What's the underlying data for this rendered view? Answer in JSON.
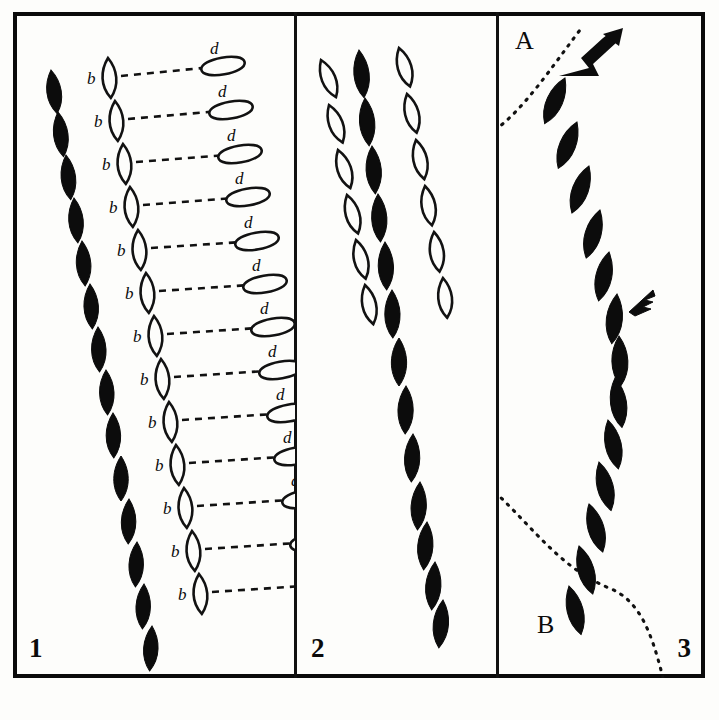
{
  "plate": {
    "title": "Comparative track-pattern plate",
    "background_color": "#fdfdfb",
    "ink_color": "#0c0c0c",
    "border_color": "#0a0a0a"
  },
  "panels": [
    {
      "number": "1",
      "label_b": "b",
      "label_d": "d",
      "description": "Filled teardrop trail at left; each outlined teardrop b linked by a dashed line to an outlined oval d",
      "filled_trail": [
        {
          "x": 38,
          "y": 58,
          "w": 19,
          "h": 44,
          "rot": -8
        },
        {
          "x": 45,
          "y": 100,
          "w": 19,
          "h": 45,
          "rot": -7
        },
        {
          "x": 53,
          "y": 143,
          "w": 19,
          "h": 45,
          "rot": -6
        },
        {
          "x": 61,
          "y": 186,
          "w": 19,
          "h": 45,
          "rot": -5
        },
        {
          "x": 69,
          "y": 229,
          "w": 19,
          "h": 45,
          "rot": -4
        },
        {
          "x": 77,
          "y": 272,
          "w": 19,
          "h": 45,
          "rot": -3
        },
        {
          "x": 85,
          "y": 315,
          "w": 19,
          "h": 45,
          "rot": -2
        },
        {
          "x": 93,
          "y": 358,
          "w": 19,
          "h": 45,
          "rot": -2
        },
        {
          "x": 100,
          "y": 401,
          "w": 19,
          "h": 45,
          "rot": -1
        },
        {
          "x": 108,
          "y": 444,
          "w": 19,
          "h": 45,
          "rot": 0
        },
        {
          "x": 116,
          "y": 487,
          "w": 19,
          "h": 45,
          "rot": 1
        },
        {
          "x": 124,
          "y": 530,
          "w": 19,
          "h": 45,
          "rot": 2
        },
        {
          "x": 131,
          "y": 572,
          "w": 19,
          "h": 45,
          "rot": 2
        },
        {
          "x": 139,
          "y": 614,
          "w": 19,
          "h": 45,
          "rot": 3
        }
      ],
      "pairs": [
        {
          "bx": 95,
          "by": 46,
          "dx": 160,
          "dy": 36,
          "blabel_x": 74,
          "blabel_y": 50,
          "dlabel_x": 197,
          "dlabel_y": 24
        },
        {
          "bx": 102,
          "by": 89,
          "dx": 168,
          "dy": 80,
          "blabel_x": 81,
          "blabel_y": 93,
          "dlabel_x": 205,
          "dlabel_y": 67
        },
        {
          "bx": 110,
          "by": 132,
          "dx": 177,
          "dy": 124,
          "blabel_x": 89,
          "blabel_y": 136,
          "dlabel_x": 214,
          "dlabel_y": 111
        },
        {
          "bx": 117,
          "by": 175,
          "dx": 185,
          "dy": 167,
          "blabel_x": 96,
          "blabel_y": 179,
          "dlabel_x": 222,
          "dlabel_y": 154
        },
        {
          "bx": 125,
          "by": 218,
          "dx": 194,
          "dy": 211,
          "blabel_x": 104,
          "blabel_y": 222,
          "dlabel_x": 231,
          "dlabel_y": 198
        },
        {
          "bx": 133,
          "by": 261,
          "dx": 202,
          "dy": 254,
          "blabel_x": 112,
          "blabel_y": 265,
          "dlabel_x": 239,
          "dlabel_y": 241
        },
        {
          "bx": 141,
          "by": 304,
          "dx": 210,
          "dy": 297,
          "blabel_x": 120,
          "blabel_y": 308,
          "dlabel_x": 247,
          "dlabel_y": 284
        },
        {
          "bx": 148,
          "by": 347,
          "dx": 218,
          "dy": 340,
          "blabel_x": 127,
          "blabel_y": 351,
          "dlabel_x": 255,
          "dlabel_y": 327
        },
        {
          "bx": 156,
          "by": 390,
          "dx": 226,
          "dy": 383,
          "blabel_x": 135,
          "blabel_y": 394,
          "dlabel_x": 263,
          "dlabel_y": 370
        },
        {
          "bx": 163,
          "by": 433,
          "dx": 233,
          "dy": 426,
          "blabel_x": 142,
          "blabel_y": 437,
          "dlabel_x": 270,
          "dlabel_y": 413
        },
        {
          "bx": 171,
          "by": 476,
          "dx": 241,
          "dy": 469,
          "blabel_x": 150,
          "blabel_y": 480,
          "dlabel_x": 278,
          "dlabel_y": 456
        },
        {
          "bx": 179,
          "by": 519,
          "dx": 249,
          "dy": 512,
          "blabel_x": 158,
          "blabel_y": 523,
          "dlabel_x": 286,
          "dlabel_y": 499
        },
        {
          "bx": 186,
          "by": 562,
          "dx": 256,
          "dy": 555,
          "blabel_x": 165,
          "blabel_y": 566,
          "dlabel_x": 293,
          "dlabel_y": 542
        }
      ]
    },
    {
      "number": "2",
      "description": "Three parallel trails: outlined teardrops left, filled teardrops centre, outlined teardrops right",
      "left_open": [
        {
          "x": 24,
          "y": 48,
          "w": 18,
          "h": 40,
          "rot": -22
        },
        {
          "x": 32,
          "y": 93,
          "w": 18,
          "h": 40,
          "rot": -20
        },
        {
          "x": 41,
          "y": 138,
          "w": 18,
          "h": 40,
          "rot": -18
        },
        {
          "x": 50,
          "y": 183,
          "w": 18,
          "h": 40,
          "rot": -16
        },
        {
          "x": 59,
          "y": 228,
          "w": 18,
          "h": 40,
          "rot": -14
        },
        {
          "x": 68,
          "y": 273,
          "w": 18,
          "h": 40,
          "rot": -12
        }
      ],
      "centre_filled": [
        {
          "x": 62,
          "y": 38,
          "w": 20,
          "h": 48,
          "rot": -6
        },
        {
          "x": 68,
          "y": 86,
          "w": 20,
          "h": 48,
          "rot": -5
        },
        {
          "x": 75,
          "y": 134,
          "w": 20,
          "h": 48,
          "rot": -4
        },
        {
          "x": 81,
          "y": 182,
          "w": 20,
          "h": 48,
          "rot": -3
        },
        {
          "x": 88,
          "y": 230,
          "w": 20,
          "h": 48,
          "rot": -2
        },
        {
          "x": 95,
          "y": 278,
          "w": 20,
          "h": 48,
          "rot": -1
        },
        {
          "x": 102,
          "y": 326,
          "w": 20,
          "h": 48,
          "rot": 0
        },
        {
          "x": 109,
          "y": 374,
          "w": 20,
          "h": 48,
          "rot": 1
        },
        {
          "x": 116,
          "y": 422,
          "w": 20,
          "h": 48,
          "rot": 2
        },
        {
          "x": 123,
          "y": 470,
          "w": 20,
          "h": 48,
          "rot": 3
        },
        {
          "x": 130,
          "y": 510,
          "w": 20,
          "h": 48,
          "rot": 4
        },
        {
          "x": 138,
          "y": 550,
          "w": 20,
          "h": 48,
          "rot": 4
        },
        {
          "x": 146,
          "y": 588,
          "w": 20,
          "h": 48,
          "rot": 5
        }
      ],
      "right_open": [
        {
          "x": 102,
          "y": 36,
          "w": 18,
          "h": 40,
          "rot": -16
        },
        {
          "x": 110,
          "y": 82,
          "w": 18,
          "h": 40,
          "rot": -14
        },
        {
          "x": 119,
          "y": 128,
          "w": 18,
          "h": 40,
          "rot": -12
        },
        {
          "x": 128,
          "y": 174,
          "w": 18,
          "h": 40,
          "rot": -10
        },
        {
          "x": 137,
          "y": 220,
          "w": 18,
          "h": 40,
          "rot": -8
        },
        {
          "x": 146,
          "y": 266,
          "w": 18,
          "h": 40,
          "rot": -6
        }
      ]
    },
    {
      "number": "3",
      "label_a": "A",
      "label_b": "B",
      "description": "Single sinuous filled trail with an arrow at top, a small flag marker midway, and dotted contour lines A and B",
      "filled_trail": [
        {
          "x": 66,
          "y": 66,
          "w": 21,
          "h": 50,
          "rot": 24
        },
        {
          "x": 78,
          "y": 110,
          "w": 21,
          "h": 50,
          "rot": 22
        },
        {
          "x": 90,
          "y": 154,
          "w": 21,
          "h": 50,
          "rot": 20
        },
        {
          "x": 101,
          "y": 198,
          "w": 21,
          "h": 50,
          "rot": 16
        },
        {
          "x": 110,
          "y": 240,
          "w": 21,
          "h": 50,
          "rot": 12
        },
        {
          "x": 118,
          "y": 282,
          "w": 21,
          "h": 50,
          "rot": 6
        },
        {
          "x": 120,
          "y": 324,
          "w": 21,
          "h": 50,
          "rot": -2
        },
        {
          "x": 116,
          "y": 366,
          "w": 21,
          "h": 50,
          "rot": -8
        },
        {
          "x": 109,
          "y": 408,
          "w": 21,
          "h": 50,
          "rot": -12
        },
        {
          "x": 100,
          "y": 450,
          "w": 21,
          "h": 50,
          "rot": -14
        },
        {
          "x": 90,
          "y": 492,
          "w": 21,
          "h": 50,
          "rot": -16
        },
        {
          "x": 80,
          "y": 534,
          "w": 21,
          "h": 50,
          "rot": -16
        },
        {
          "x": 70,
          "y": 574,
          "w": 21,
          "h": 50,
          "rot": -14
        }
      ],
      "arrow": {
        "x": 60,
        "y": 18
      },
      "flag": {
        "x": 130,
        "y": 274
      },
      "label_a_pos": {
        "x": 16,
        "y": 16
      },
      "label_b_pos": {
        "x": 38,
        "y": 600
      }
    }
  ]
}
